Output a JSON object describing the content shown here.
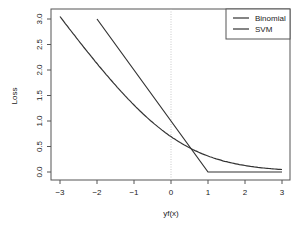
{
  "chart_data": {
    "type": "line",
    "title": "",
    "xlabel": "yf(x)",
    "ylabel": "Loss",
    "xlim": [
      -3,
      3
    ],
    "ylim": [
      0,
      3
    ],
    "x_ticks": [
      -3,
      -2,
      -1,
      0,
      1,
      2,
      3
    ],
    "x_tick_labels": [
      "−3",
      "−2",
      "−1",
      "0",
      "1",
      "2",
      "3"
    ],
    "y_ticks": [
      0.0,
      0.5,
      1.0,
      1.5,
      2.0,
      2.5,
      3.0
    ],
    "y_tick_labels": [
      "0.0",
      "0.5",
      "1.0",
      "1.5",
      "2.0",
      "2.5",
      "3.0"
    ],
    "grid": false,
    "reference_line": {
      "x": 0,
      "style": "dotted",
      "color": "#bbbbbb"
    },
    "legend_position": "top-right",
    "series": [
      {
        "name": "Binomial",
        "color": "#333333",
        "formula": "log(1+exp(-x))",
        "x": [
          -3,
          -2.5,
          -2,
          -1.5,
          -1,
          -0.5,
          0,
          0.5,
          1,
          1.5,
          2,
          2.5,
          3
        ],
        "values": [
          3.05,
          2.58,
          2.13,
          1.7,
          1.31,
          0.97,
          0.69,
          0.47,
          0.31,
          0.2,
          0.13,
          0.08,
          0.05
        ]
      },
      {
        "name": "SVM",
        "color": "#333333",
        "formula": "max(0, 1-x)",
        "x": [
          -2,
          1,
          3
        ],
        "values": [
          3.0,
          0.0,
          0.0
        ]
      }
    ]
  }
}
